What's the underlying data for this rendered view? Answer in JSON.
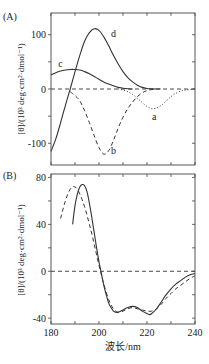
{
  "chart_data": [
    {
      "panel_label": "(A)",
      "type": "line",
      "xlim": [
        180,
        240
      ],
      "ylim": [
        -140,
        140
      ],
      "yticks": [
        -100,
        0,
        100
      ],
      "ytick_labels": [
        "-100",
        "0",
        "100"
      ],
      "xticks": [
        180,
        190,
        200,
        210,
        220,
        230,
        240
      ],
      "xtick_labels": [],
      "ylabel": "[θ]/(10³ deg·cm²·dmol⁻¹)",
      "xlabel": "",
      "zero_line": true,
      "series": [
        {
          "name": "a",
          "style": "dotted",
          "x": [
            208,
            210,
            212,
            214,
            216,
            218,
            220,
            222,
            224,
            226,
            228,
            230,
            232,
            234,
            236,
            238,
            240
          ],
          "y": [
            0,
            -2,
            -5,
            -10,
            -17,
            -25,
            -32,
            -36,
            -35,
            -30,
            -22,
            -14,
            -8,
            -4,
            -2,
            -1,
            0
          ]
        },
        {
          "name": "b",
          "style": "dashed",
          "x": [
            188,
            190,
            192,
            194,
            196,
            198,
            200,
            202,
            204,
            206,
            208,
            210,
            212,
            214,
            216,
            218,
            220,
            222,
            224,
            226
          ],
          "y": [
            -5,
            -12,
            -22,
            -40,
            -62,
            -86,
            -108,
            -120,
            -114,
            -95,
            -72,
            -52,
            -36,
            -24,
            -14,
            -7,
            -3,
            -1,
            0,
            0
          ]
        },
        {
          "name": "c",
          "style": "solid",
          "x": [
            180,
            182,
            184,
            186,
            188,
            190,
            192,
            194,
            196,
            198,
            200,
            202,
            204,
            206,
            208,
            210,
            212,
            214
          ],
          "y": [
            26,
            30,
            33,
            35,
            36,
            36,
            35,
            32,
            28,
            23,
            18,
            13,
            9,
            6,
            3,
            1.5,
            0.5,
            0
          ]
        },
        {
          "name": "d",
          "style": "solid",
          "x": [
            180,
            182,
            184,
            186,
            188,
            190,
            192,
            194,
            196,
            198,
            200,
            202,
            204,
            206,
            208,
            210,
            212,
            214,
            216,
            218,
            220,
            222,
            224
          ],
          "y": [
            -115,
            -92,
            -62,
            -30,
            0,
            32,
            62,
            88,
            104,
            111,
            108,
            96,
            80,
            62,
            46,
            32,
            21,
            13,
            7,
            3,
            1,
            0.3,
            0
          ]
        }
      ],
      "annotations": [
        {
          "text": "a",
          "x": 223,
          "y": -52
        },
        {
          "text": "b",
          "x": 206,
          "y": -115
        },
        {
          "text": "c",
          "x": 184,
          "y": 46
        },
        {
          "text": "d",
          "x": 206,
          "y": 102
        }
      ]
    },
    {
      "panel_label": "(B)",
      "type": "line",
      "xlim": [
        180,
        240
      ],
      "ylim": [
        -44,
        82
      ],
      "yticks": [
        -40,
        0,
        40,
        80
      ],
      "ytick_labels": [
        "-40",
        "0",
        "40",
        "80"
      ],
      "xticks": [
        180,
        190,
        200,
        210,
        220,
        230,
        240
      ],
      "xtick_labels": [
        "180",
        "200",
        "220",
        "240"
      ],
      "xtick_label_values": [
        180,
        200,
        220,
        240
      ],
      "ylabel": "[θ]/(10³ deg·cm²·dmol⁻¹)",
      "xlabel": "波长/nm",
      "zero_line": true,
      "series": [
        {
          "name": "solid",
          "style": "solid",
          "x": [
            189,
            190,
            191,
            192,
            193,
            194,
            195,
            196,
            197,
            198,
            199,
            200,
            201,
            202,
            203,
            204,
            205,
            206,
            207,
            208,
            210,
            212,
            214,
            216,
            218,
            220,
            221,
            222,
            224,
            226,
            228,
            230,
            232,
            234,
            236,
            238,
            240
          ],
          "y": [
            40,
            56,
            66,
            72,
            74,
            73,
            68,
            58,
            46,
            33,
            20,
            8,
            -2,
            -12,
            -20,
            -27,
            -31,
            -34,
            -35,
            -35,
            -33,
            -31,
            -30,
            -31,
            -34,
            -36,
            -37,
            -36,
            -32,
            -26,
            -20,
            -15,
            -11,
            -8,
            -5,
            -3,
            -2
          ]
        },
        {
          "name": "dashed",
          "style": "dashed",
          "x": [
            184,
            185,
            186,
            187,
            188,
            189,
            190,
            191,
            192,
            193,
            194,
            195,
            196,
            197,
            198,
            199,
            200,
            201,
            202,
            204,
            206,
            208,
            210,
            212,
            214,
            216,
            218,
            220,
            222,
            224,
            226,
            228,
            230,
            232,
            234,
            236,
            238,
            240
          ],
          "y": [
            45,
            53,
            60,
            66,
            70,
            72,
            72,
            70,
            66,
            61,
            55,
            48,
            40,
            32,
            23,
            14,
            5,
            -3,
            -11,
            -24,
            -32,
            -35,
            -34,
            -32,
            -31,
            -32,
            -33,
            -34,
            -34,
            -32,
            -28,
            -23,
            -19,
            -15,
            -12,
            -9,
            -6,
            -4
          ]
        }
      ],
      "annotations": []
    }
  ]
}
